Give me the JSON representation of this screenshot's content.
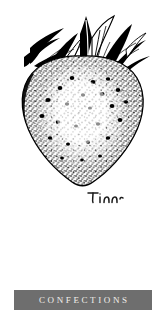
{
  "page": {
    "background_color": "#ffffff",
    "width": 165,
    "height": 321
  },
  "illustration": {
    "name": "strawberry-pen-and-ink-drawing",
    "subject": "strawberry",
    "style": "pen-and-ink stipple engraving",
    "ink_color": "#000000",
    "paper_color": "#ffffff",
    "parts": {
      "calyx_label": "strawberry-calyx-leaves",
      "body_label": "strawberry-body",
      "seeds_label": "strawberry-seeds",
      "highlight_label": "strawberry-highlight"
    }
  },
  "signature": {
    "text": "Tina",
    "ink_color": "#1a1a1a"
  },
  "caption": {
    "label": "CONFECTIONS",
    "band_color": "#6e6e6e",
    "text_color": "#f2f0ec"
  }
}
